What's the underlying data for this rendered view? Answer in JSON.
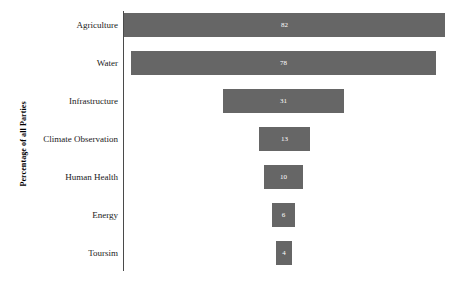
{
  "chart_data": {
    "type": "bar",
    "orientation": "horizontal",
    "layout": "funnel-centered",
    "title": "",
    "xlabel": "",
    "ylabel": "Percentage of all Parties",
    "categories": [
      "Agriculture",
      "Water",
      "Infrastructure",
      "Climate Observation",
      "Human Health",
      "Energy",
      "Toursim"
    ],
    "values": [
      82,
      78,
      31,
      13,
      10,
      6,
      4
    ],
    "value_labels": [
      "82",
      "78",
      "31",
      "13",
      "10",
      "6",
      "4"
    ],
    "xlim": [
      0,
      100
    ],
    "grid": false,
    "legend": false,
    "bar_color": "#666666",
    "value_label_color": "#ffffff",
    "axis_color": "#4a4a4a"
  },
  "axis": {
    "y_title": "Percentage of all Parties"
  }
}
